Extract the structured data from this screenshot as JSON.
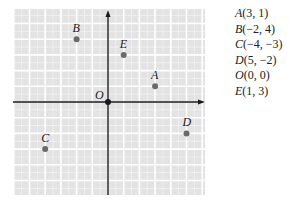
{
  "figure": {
    "origin_label": "O",
    "axis_color": "#1a1a1a",
    "grid_background": "#e3e3e3",
    "grid_line_color": "#ffffff",
    "point_color": "#6a6a6a",
    "x_range": [
      -6,
      6
    ],
    "y_range": [
      -6,
      6
    ]
  },
  "points": [
    {
      "name": "A",
      "x": 3,
      "y": 1,
      "label": "A",
      "coords": "(3, 1)"
    },
    {
      "name": "B",
      "x": -2,
      "y": 4,
      "label": "B",
      "coords": "(−2, 4)"
    },
    {
      "name": "C",
      "x": -4,
      "y": -3,
      "label": "C",
      "coords": "(−4, −3)"
    },
    {
      "name": "D",
      "x": 5,
      "y": -2,
      "label": "D",
      "coords": "(5, −2)"
    },
    {
      "name": "O",
      "x": 0,
      "y": 0,
      "label": "O",
      "coords": "(0, 0)"
    },
    {
      "name": "E",
      "x": 1,
      "y": 3,
      "label": "E",
      "coords": "(1, 3)"
    }
  ]
}
